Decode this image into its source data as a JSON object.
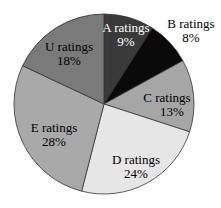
{
  "chart_data": {
    "type": "pie",
    "title": "",
    "categories": [
      "A ratings",
      "B ratings",
      "C ratings",
      "D ratings",
      "E ratings",
      "U ratings"
    ],
    "values": [
      9,
      8,
      13,
      24,
      28,
      18
    ],
    "unit": "%",
    "start_angle_deg": 0,
    "direction": "clockwise",
    "colors": [
      "#3a3a3a",
      "#0a0a0a",
      "#a6a6a6",
      "#e6e6e6",
      "#a9a9a9",
      "#7a7a7a"
    ],
    "label_colors": [
      "#ffffff",
      "#000000",
      "#000000",
      "#000000",
      "#000000",
      "#000000"
    ],
    "labels": [
      {
        "name": "A ratings",
        "pct": "9%"
      },
      {
        "name": "B ratings",
        "pct": "8%"
      },
      {
        "name": "C ratings",
        "pct": "13%"
      },
      {
        "name": "D ratings",
        "pct": "24%"
      },
      {
        "name": "E ratings",
        "pct": "28%"
      },
      {
        "name": "U ratings",
        "pct": "18%"
      }
    ],
    "legend": "none"
  }
}
